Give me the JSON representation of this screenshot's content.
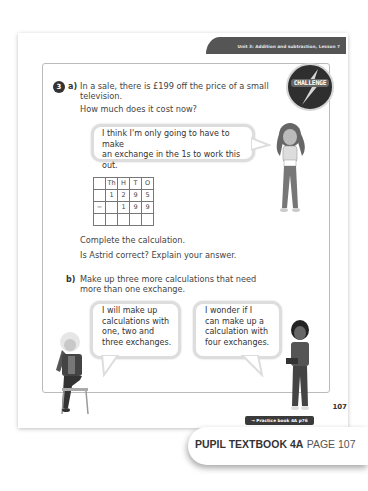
{
  "header": {
    "unit_label": "Unit 3: Addition and subtraction, Lesson 7"
  },
  "badge": {
    "label": "CHALLENGE"
  },
  "question": {
    "number": "3",
    "part_a": {
      "letter": "a)",
      "line1": "In a sale, there is £199 off the price of a small",
      "line2": "television.",
      "line3": "How much does it cost now?",
      "bubble": {
        "line1": "I think I'm only going to have to make",
        "line2": "an exchange in the 1s to work this out."
      },
      "table": {
        "headers": [
          "",
          "Th",
          "H",
          "T",
          "O"
        ],
        "rows": [
          [
            "",
            "1",
            "2",
            "9",
            "5"
          ],
          [
            "−",
            "",
            "1",
            "9",
            "9"
          ],
          [
            "",
            "",
            "",
            "",
            ""
          ]
        ]
      },
      "instruction1": "Complete the calculation.",
      "instruction2": "Is Astrid correct? Explain your answer."
    },
    "part_b": {
      "letter": "b)",
      "line1": "Make up three more calculations that need",
      "line2": "more than one exchange.",
      "bubble_left": {
        "line1": "I will make up",
        "line2": "calculations with",
        "line3": "one, two and",
        "line4": "three exchanges."
      },
      "bubble_right": {
        "line1": "I wonder if I",
        "line2": "can make up a",
        "line3": "calculation with",
        "line4": "four exchanges."
      }
    }
  },
  "page_number": "107",
  "practice_link": "→ Practice book 4A p76",
  "footer": {
    "book": "PUPIL TEXTBOOK 4A",
    "page": "PAGE 107"
  }
}
